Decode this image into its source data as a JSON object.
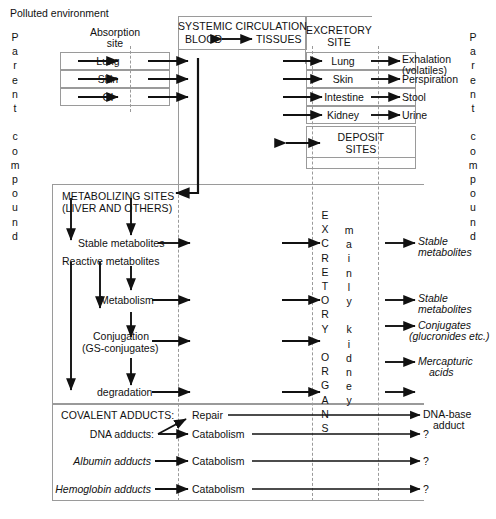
{
  "diagram": {
    "title_note": "Polluted environment",
    "left_vertical_label": "P\na\nr\ne\nn\nt\n\nc\no\nm\np\no\nu\nn\nd",
    "right_vertical_label": "P\na\nr\ne\nn\nt\n\nc\no\nm\np\no\nu\nn\nd",
    "excretory_organs_label": "E\nX\nC\nR\nE\nT\nO\nR\nY\n\nO\nR\nG\nA\nN\nS",
    "mainly_kidney_label": "m\na\ni\nn\nl\ny\n\nk\ni\nd\nn\ne\ny"
  },
  "absorption": {
    "header_line1": "Absorption",
    "header_line2": "site",
    "rows": [
      "Lung",
      "Skin",
      "GI"
    ]
  },
  "systemic": {
    "header_line1": "SYSTEMIC CIRCULATION",
    "blood": "BLOOD",
    "tissues": "TISSUES"
  },
  "excretory": {
    "header_line1": "EXCRETORY",
    "header_line2": "SITE",
    "rows": [
      "Lung",
      "Skin",
      "Intestine",
      "Kidney"
    ],
    "outputs": [
      "Exhalation",
      "(volatiles)",
      "Perspiration",
      "Stool",
      "Urine"
    ],
    "deposit_line1": "DEPOSIT",
    "deposit_line2": "SITES"
  },
  "metabolizing": {
    "header_line1": "METABOLIZING SITES",
    "header_line2": "(LIVER AND OTHERS)",
    "steps": [
      "Stable metabolites",
      "Reactive metabolites",
      "Metabolism",
      "Conjugation",
      "(GS-conjugates)",
      "degradation"
    ]
  },
  "right_outputs": {
    "stable_1_line1": "Stable",
    "stable_1_line2": "metabolites",
    "stable_2_line1": "Stable",
    "stable_2_line2": "metabolites",
    "conjugates_line1": "Conjugates",
    "conjugates_line2": "(glucronides etc.)",
    "mercapturic_line1": "Mercapturic",
    "mercapturic_line2": "acids"
  },
  "adducts": {
    "header": "COVALENT ADDUCTS:",
    "dna_label": "DNA adducts:",
    "albumin_label": "Albumin adducts",
    "hemoglobin_label": "Hemoglobin adducts",
    "repair": "Repair",
    "catabolism_1": "Catabolism",
    "catabolism_2": "Catabolism",
    "catabolism_3": "Catabolism",
    "dna_base_line1": "DNA-base",
    "dna_base_line2": "adduct",
    "unknown_1": "?",
    "unknown_2": "?",
    "unknown_3": "?"
  }
}
